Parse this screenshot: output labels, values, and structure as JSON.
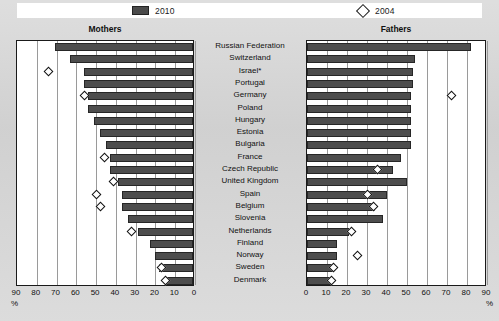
{
  "legend": {
    "series": [
      {
        "key": "s2010",
        "label": "2010",
        "icon": "bar-swatch-icon",
        "color": "#4d4d4d"
      },
      {
        "key": "s2004",
        "label": "2004",
        "icon": "diamond-marker-icon",
        "color": "#ffffff"
      }
    ]
  },
  "panels": {
    "left": {
      "title": "Mothers"
    },
    "right": {
      "title": "Fathers"
    }
  },
  "axis": {
    "left_ticks": [
      "90",
      "80",
      "70",
      "60",
      "50",
      "40",
      "30",
      "20",
      "10",
      "0"
    ],
    "right_ticks": [
      "0",
      "10",
      "20",
      "30",
      "40",
      "50",
      "60",
      "70",
      "80",
      "90"
    ],
    "unit_left": "%",
    "unit_right": "%"
  },
  "chart_data": {
    "type": "bar",
    "title": "",
    "xlabel": "%",
    "ylabel": "",
    "xlim": [
      0,
      90
    ],
    "grid": true,
    "legend_position": "top",
    "orientation": "horizontal-bidirectional",
    "categories": [
      "Russian Federation",
      "Switzerland",
      "Israel*",
      "Portugal",
      "Germany",
      "Poland",
      "Hungary",
      "Estonia",
      "Bulgaria",
      "France",
      "Czech Republic",
      "United Kingdom",
      "Spain",
      "Belgium",
      "Slovenia",
      "Netherlands",
      "Finland",
      "Norway",
      "Sweden",
      "Denmark"
    ],
    "panels": [
      {
        "name": "Mothers",
        "direction": "rtl",
        "series": [
          {
            "name": "2010",
            "type": "bar",
            "values": [
              70,
              62,
              55,
              55,
              53,
              53,
              50,
              47,
              44,
              42,
              42,
              38,
              36,
              36,
              33,
              28,
              22,
              19,
              17,
              14
            ]
          },
          {
            "name": "2004",
            "type": "marker",
            "values": [
              null,
              null,
              73,
              null,
              55,
              null,
              null,
              null,
              null,
              45,
              null,
              40,
              49,
              47,
              null,
              31,
              null,
              null,
              16,
              14
            ]
          }
        ]
      },
      {
        "name": "Fathers",
        "direction": "ltr",
        "series": [
          {
            "name": "2010",
            "type": "bar",
            "values": [
              82,
              54,
              53,
              53,
              52,
              52,
              52,
              52,
              52,
              47,
              43,
              50,
              40,
              34,
              38,
              21,
              15,
              15,
              13,
              12
            ]
          },
          {
            "name": "2004",
            "type": "marker",
            "values": [
              null,
              null,
              null,
              null,
              72,
              null,
              null,
              null,
              null,
              null,
              35,
              null,
              30,
              33,
              null,
              22,
              null,
              25,
              13,
              12
            ]
          }
        ]
      }
    ]
  }
}
